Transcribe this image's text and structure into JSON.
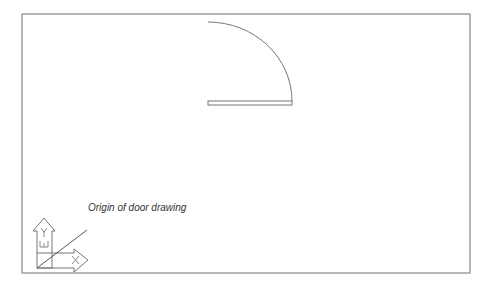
{
  "diagram": {
    "annotation": "Origin of door drawing",
    "ucs_icon": {
      "x_label": "X",
      "y_label": "Y",
      "w_label": "W"
    },
    "colors": {
      "line": "#777777",
      "frame": "#888888",
      "text": "#333333",
      "background": "#ffffff"
    }
  }
}
